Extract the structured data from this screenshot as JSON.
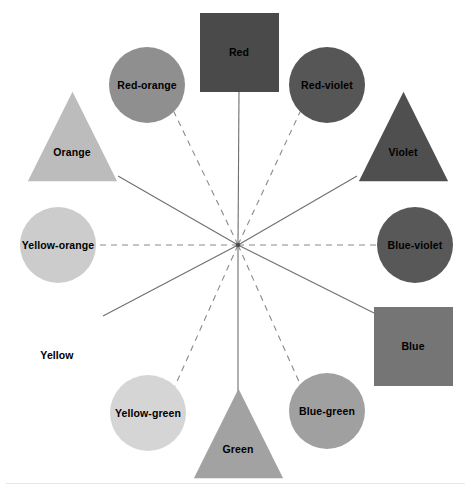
{
  "diagram": {
    "hub": {
      "x": 238,
      "y": 245,
      "label": "center-hub"
    },
    "canvas": {
      "width": 473,
      "height": 490,
      "background": "#ffffff"
    },
    "line_colors": {
      "solid": "#6f6f6f",
      "dashed": "#8a8a8a"
    },
    "nodes": [
      {
        "id": "red",
        "label": "Red",
        "shape": "square",
        "category": "primary",
        "line_style": "solid",
        "color": "#4a4a4a",
        "text_color": "#000000",
        "cx": 239,
        "cy": 52,
        "size": 79,
        "angle_deg": 90,
        "attach_x": 239,
        "attach_y": 92
      },
      {
        "id": "red-orange",
        "label": "Red-orange",
        "shape": "circle",
        "category": "tertiary",
        "line_style": "dashed",
        "color": "#8f8f8f",
        "text_color": "#000000",
        "cx": 147,
        "cy": 85,
        "size": 76,
        "angle_deg": 120,
        "attach_x": 174,
        "attach_y": 112
      },
      {
        "id": "red-violet",
        "label": "Red-violet",
        "shape": "circle",
        "category": "tertiary",
        "line_style": "dashed",
        "color": "#565656",
        "text_color": "#000000",
        "cx": 327,
        "cy": 85,
        "size": 76,
        "angle_deg": 60,
        "attach_x": 300,
        "attach_y": 112
      },
      {
        "id": "orange",
        "label": "Orange",
        "shape": "triangle",
        "category": "secondary",
        "line_style": "solid",
        "color": "#bcbcbc",
        "text_color": "#000000",
        "cx": 72,
        "cy": 136,
        "size": 93,
        "angle_deg": 150,
        "attach_x": 118,
        "attach_y": 176
      },
      {
        "id": "violet",
        "label": "Violet",
        "shape": "triangle",
        "category": "secondary",
        "line_style": "solid",
        "color": "#4f4f4f",
        "text_color": "#000000",
        "cx": 403,
        "cy": 136,
        "size": 93,
        "angle_deg": 30,
        "attach_x": 357,
        "attach_y": 176
      },
      {
        "id": "yellow-orange",
        "label": "Yellow-orange",
        "shape": "circle",
        "category": "tertiary",
        "line_style": "dashed",
        "color": "#cccccc",
        "text_color": "#000000",
        "cx": 58,
        "cy": 245,
        "size": 76,
        "angle_deg": 180,
        "attach_x": 96,
        "attach_y": 245
      },
      {
        "id": "blue-violet",
        "label": "Blue-violet",
        "shape": "circle",
        "category": "tertiary",
        "line_style": "dashed",
        "color": "#585858",
        "text_color": "#000000",
        "cx": 415,
        "cy": 245,
        "size": 76,
        "angle_deg": 0,
        "attach_x": 377,
        "attach_y": 245
      },
      {
        "id": "yellow",
        "label": "Yellow",
        "shape": "triangle",
        "category": "primary",
        "line_style": "solid",
        "color": "#ffffff",
        "text_color": "#000000",
        "cx": 57,
        "cy": 339,
        "size": 93,
        "angle_deg": 210,
        "attach_x": 103,
        "attach_y": 316
      },
      {
        "id": "blue",
        "label": "Blue",
        "shape": "square",
        "category": "primary",
        "line_style": "solid",
        "color": "#757575",
        "text_color": "#000000",
        "cx": 413,
        "cy": 346,
        "size": 79,
        "angle_deg": 330,
        "attach_x": 374,
        "attach_y": 313
      },
      {
        "id": "yellow-green",
        "label": "Yellow-green",
        "shape": "circle",
        "category": "tertiary",
        "line_style": "dashed",
        "color": "#d5d5d5",
        "text_color": "#000000",
        "cx": 148,
        "cy": 413,
        "size": 76,
        "angle_deg": 240,
        "attach_x": 175,
        "attach_y": 386
      },
      {
        "id": "blue-green",
        "label": "Blue-green",
        "shape": "circle",
        "category": "tertiary",
        "line_style": "dashed",
        "color": "#a0a0a0",
        "text_color": "#000000",
        "cx": 327,
        "cy": 411,
        "size": 76,
        "angle_deg": 300,
        "attach_x": 300,
        "attach_y": 384
      },
      {
        "id": "green",
        "label": "Green",
        "shape": "triangle",
        "category": "secondary",
        "line_style": "solid",
        "color": "#a2a2a2",
        "text_color": "#000000",
        "cx": 238,
        "cy": 433,
        "size": 93,
        "angle_deg": 270,
        "attach_x": 238,
        "attach_y": 394
      }
    ]
  }
}
